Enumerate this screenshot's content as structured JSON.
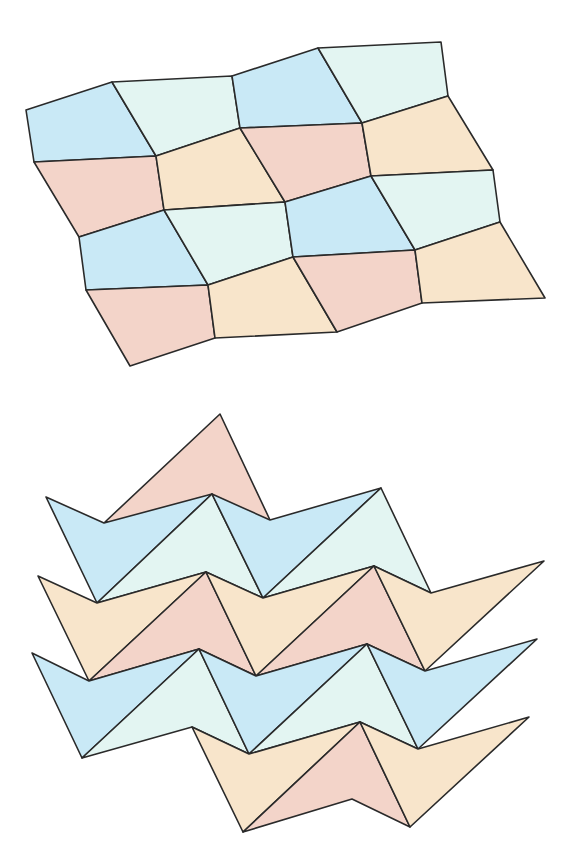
{
  "figure": {
    "colors": {
      "blue": "#c9e9f6",
      "cyan": "#e3f5f2",
      "pink": "#f3d4c9",
      "yellow": "#f8e5cb",
      "stroke": "#2a2a2a"
    },
    "quad_tiling": {
      "rows": [
        [
          [
            26,
            110
          ],
          [
            112,
            82
          ],
          [
            232,
            76
          ],
          [
            318,
            48
          ],
          [
            441,
            42
          ]
        ],
        [
          [
            34,
            162
          ],
          [
            156,
            156
          ],
          [
            240,
            128
          ],
          [
            362,
            123
          ],
          [
            448,
            96
          ]
        ],
        [
          [
            79,
            237
          ],
          [
            164,
            210
          ],
          [
            285,
            202
          ],
          [
            371,
            176
          ],
          [
            493,
            170
          ]
        ],
        [
          [
            86,
            290
          ],
          [
            208,
            285
          ],
          [
            293,
            257
          ],
          [
            415,
            250
          ],
          [
            500,
            222
          ]
        ],
        [
          [
            130,
            366
          ],
          [
            215,
            338
          ],
          [
            337,
            332
          ],
          [
            422,
            303
          ],
          [
            545,
            298
          ]
        ]
      ],
      "fills": [
        [
          "blue",
          "cyan",
          "blue",
          "cyan"
        ],
        [
          "pink",
          "yellow",
          "pink",
          "yellow"
        ],
        [
          "blue",
          "cyan",
          "blue",
          "cyan"
        ],
        [
          "pink",
          "yellow",
          "pink",
          "yellow"
        ]
      ]
    },
    "triangle_tiling": {
      "top_triangle": {
        "points": [
          [
            105,
            522
          ],
          [
            220,
            414
          ],
          [
            270,
            520
          ]
        ],
        "fill": "pink"
      },
      "polygons": [
        {
          "points": [
            [
              46,
              497
            ],
            [
              104,
              523
            ],
            [
              212,
              494
            ],
            [
              97,
              603
            ]
          ],
          "fill": "blue"
        },
        {
          "points": [
            [
              212,
              494
            ],
            [
              97,
              603
            ],
            [
              206,
              572
            ],
            [
              263,
              598
            ]
          ],
          "fill": "cyan"
        },
        {
          "points": [
            [
              212,
              494
            ],
            [
              270,
              520
            ],
            [
              381,
              488
            ],
            [
              263,
              598
            ]
          ],
          "fill": "blue"
        },
        {
          "points": [
            [
              381,
              488
            ],
            [
              263,
              598
            ],
            [
              374,
              566
            ],
            [
              431,
              593
            ]
          ],
          "fill": "cyan"
        },
        {
          "points": [
            [
              38,
              576
            ],
            [
              97,
              603
            ],
            [
              206,
              572
            ],
            [
              89,
              681
            ]
          ],
          "fill": "yellow"
        },
        {
          "points": [
            [
              206,
              572
            ],
            [
              89,
              681
            ],
            [
              199,
              649
            ],
            [
              256,
              676
            ]
          ],
          "fill": "pink"
        },
        {
          "points": [
            [
              206,
              572
            ],
            [
              263,
              598
            ],
            [
              374,
              566
            ],
            [
              256,
              676
            ]
          ],
          "fill": "yellow"
        },
        {
          "points": [
            [
              374,
              566
            ],
            [
              256,
              676
            ],
            [
              367,
              644
            ],
            [
              425,
              671
            ]
          ],
          "fill": "pink"
        },
        {
          "points": [
            [
              374,
              566
            ],
            [
              431,
              593
            ],
            [
              544,
              561
            ],
            [
              425,
              671
            ]
          ],
          "fill": "yellow"
        },
        {
          "points": [
            [
              32,
              653
            ],
            [
              89,
              681
            ],
            [
              199,
              649
            ],
            [
              82,
              758
            ]
          ],
          "fill": "blue"
        },
        {
          "points": [
            [
              199,
              649
            ],
            [
              82,
              758
            ],
            [
              192,
              727
            ],
            [
              249,
              754
            ]
          ],
          "fill": "cyan"
        },
        {
          "points": [
            [
              199,
              649
            ],
            [
              256,
              676
            ],
            [
              367,
              644
            ],
            [
              249,
              754
            ]
          ],
          "fill": "blue"
        },
        {
          "points": [
            [
              367,
              644
            ],
            [
              249,
              754
            ],
            [
              360,
              722
            ],
            [
              418,
              749
            ]
          ],
          "fill": "cyan"
        },
        {
          "points": [
            [
              367,
              644
            ],
            [
              425,
              671
            ],
            [
              537,
              639
            ],
            [
              418,
              749
            ]
          ],
          "fill": "blue"
        },
        {
          "points": [
            [
              192,
              727
            ],
            [
              249,
              754
            ],
            [
              360,
              722
            ],
            [
              243,
              832
            ]
          ],
          "fill": "yellow"
        },
        {
          "points": [
            [
              360,
              722
            ],
            [
              243,
              832
            ],
            [
              352,
              799
            ],
            [
              410,
              827
            ]
          ],
          "fill": "pink"
        },
        {
          "points": [
            [
              360,
              722
            ],
            [
              418,
              749
            ],
            [
              529,
              717
            ],
            [
              410,
              827
            ]
          ],
          "fill": "yellow"
        }
      ]
    }
  }
}
